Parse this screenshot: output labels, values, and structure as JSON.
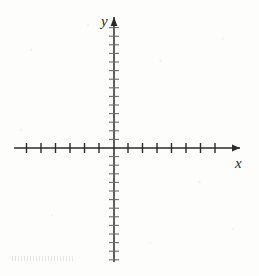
{
  "figure": {
    "kind": "cartesian-coordinate-plane",
    "background_color": "#fdfdfc",
    "ink_color": "#2a2a2a"
  },
  "axes": {
    "x": {
      "label": "x",
      "label_style": "italic",
      "origin_px": 113.5,
      "line_y_px": 148,
      "start_px": 14,
      "end_px": 240,
      "arrow_at": "right",
      "tick_spacing_px": 14.5,
      "tick_half_length_px": 5,
      "ticks_negative": 7,
      "ticks_positive": 7,
      "tick_values": [
        -7,
        -6,
        -5,
        -4,
        -3,
        -2,
        -1,
        1,
        2,
        3,
        4,
        5,
        6,
        7
      ],
      "tick_labels_shown": false
    },
    "y": {
      "label": "y",
      "label_style": "italic",
      "origin_px": 148,
      "line_x_px": 114,
      "start_px": 17,
      "end_px": 262,
      "arrow_at": "top",
      "tick_spacing_px": 8.6,
      "tick_half_length_px": 5,
      "ticks_positive": 14,
      "ticks_negative": 13,
      "tick_values": [
        -13,
        -12,
        -11,
        -10,
        -9,
        -8,
        -7,
        -6,
        -5,
        -4,
        -3,
        -2,
        -1,
        1,
        2,
        3,
        4,
        5,
        6,
        7,
        8,
        9,
        10,
        11,
        12,
        13,
        14
      ],
      "tick_labels_shown": false
    }
  },
  "chart_data": {
    "type": "scatter",
    "title": "",
    "subtitle": "",
    "xlabel": "x",
    "ylabel": "y",
    "xlim": [
      -7,
      8.5
    ],
    "ylim": [
      -13.5,
      15
    ],
    "grid": false,
    "legend": null,
    "legend_position": "none",
    "x_tick_labels": [],
    "y_tick_labels": [],
    "annotations": [],
    "series": [
      {
        "name": "",
        "x": [],
        "y": []
      }
    ],
    "note": "Empty grid — no data is plotted; axes and tick marks only"
  }
}
